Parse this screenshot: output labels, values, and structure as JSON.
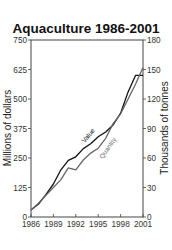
{
  "chart_data": {
    "type": "line",
    "title": "Aquaculture 1986-2001",
    "xlabel": "",
    "ylabel": "Millions of dollars",
    "y2label": "Thousands of tonnes",
    "x": [
      1986,
      1987,
      1988,
      1989,
      1990,
      1991,
      1992,
      1993,
      1994,
      1995,
      1996,
      1997,
      1998,
      1999,
      2000,
      2001
    ],
    "xticks": [
      "1986",
      "1989",
      "1992",
      "1995",
      "1998",
      "2001"
    ],
    "yticks": [
      "0",
      "125",
      "250",
      "375",
      "500",
      "625",
      "750"
    ],
    "y2ticks": [
      "0",
      "30",
      "60",
      "90",
      "120",
      "150",
      "180"
    ],
    "ylim": [
      0,
      750
    ],
    "y2lim": [
      0,
      180
    ],
    "grid": false,
    "legend_position": "inline",
    "series": [
      {
        "name": "Value",
        "axis": "left",
        "color": "#111111",
        "values": [
          30,
          55,
          95,
          140,
          200,
          240,
          255,
          290,
          310,
          340,
          360,
          390,
          440,
          530,
          600,
          600
        ]
      },
      {
        "name": "Quantity",
        "axis": "right",
        "color": "#666666",
        "values": [
          7,
          14,
          22,
          30,
          38,
          50,
          48,
          58,
          65,
          70,
          80,
          95,
          105,
          120,
          135,
          152
        ]
      }
    ]
  }
}
